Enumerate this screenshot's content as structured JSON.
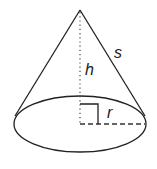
{
  "diagram": {
    "labels": {
      "slant_height": "s",
      "height": "h",
      "radius": "r"
    },
    "colors": {
      "stroke": "#222222",
      "background": "#ffffff"
    }
  }
}
